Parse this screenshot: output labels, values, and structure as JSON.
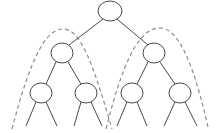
{
  "diagram": {
    "type": "binary-tree",
    "colors": {
      "node_stroke": "#4a4a4a",
      "edge": "#4a4a4a",
      "subtree_outline": "#8c8c8c",
      "background": "#ffffff"
    },
    "nodes": [
      {
        "id": "root",
        "cx": 110,
        "cy": 11,
        "rx": 12,
        "ry": 10
      },
      {
        "id": "left-child",
        "cx": 62,
        "cy": 53,
        "rx": 11,
        "ry": 10
      },
      {
        "id": "right-child",
        "cx": 154,
        "cy": 53,
        "rx": 11,
        "ry": 10
      },
      {
        "id": "leaf-1",
        "cx": 41,
        "cy": 93,
        "rx": 11,
        "ry": 10
      },
      {
        "id": "leaf-2",
        "cx": 86,
        "cy": 93,
        "rx": 11,
        "ry": 10
      },
      {
        "id": "leaf-3",
        "cx": 132,
        "cy": 93,
        "rx": 11,
        "ry": 10
      },
      {
        "id": "leaf-4",
        "cx": 180,
        "cy": 93,
        "rx": 11,
        "ry": 10
      }
    ],
    "edges": [
      {
        "from": "root",
        "to": "left-child"
      },
      {
        "from": "root",
        "to": "right-child"
      },
      {
        "from": "left-child",
        "to": "leaf-1"
      },
      {
        "from": "left-child",
        "to": "leaf-2"
      },
      {
        "from": "right-child",
        "to": "leaf-3"
      },
      {
        "from": "right-child",
        "to": "leaf-4"
      }
    ],
    "dangling_edges": 8,
    "subtree_outlines": [
      {
        "id": "left-subtree-outline",
        "peak_x": 62,
        "peak_y": 29
      },
      {
        "id": "right-subtree-outline",
        "peak_x": 160,
        "peak_y": 28
      }
    ]
  }
}
